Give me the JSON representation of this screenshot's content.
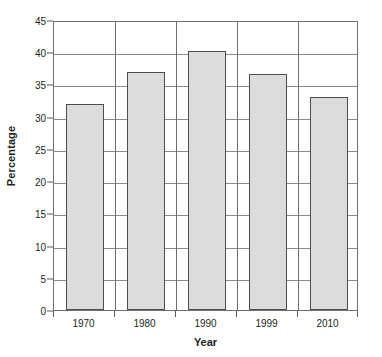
{
  "chart_data": {
    "type": "bar",
    "title": "",
    "subtitle": "",
    "xlabel": "Year",
    "ylabel": "Percentage",
    "categories": [
      "1970",
      "1980",
      "1990",
      "1999",
      "2010"
    ],
    "values": [
      32,
      37,
      40.2,
      36.7,
      33
    ],
    "series": [
      {
        "name": "Percentage",
        "values": [
          32,
          37,
          40.2,
          36.7,
          33
        ]
      }
    ],
    "ylim": [
      0,
      45
    ],
    "y_ticks": [
      0,
      5,
      10,
      15,
      20,
      25,
      30,
      35,
      40,
      45
    ],
    "y_tick_labels": [
      "0",
      "5",
      "10",
      "15",
      "20",
      "25",
      "30",
      "35",
      "40",
      "45"
    ],
    "x_tick_labels": [
      "1970",
      "1980",
      "1990",
      "1999",
      "2010"
    ],
    "grid": true,
    "grid_axis": "y",
    "legend": false,
    "legend_position": "none",
    "annotations": [],
    "colors": {
      "bar_fill": "#dcdcdc",
      "bar_border": "#4d4d4d",
      "gridline": "#8a8a8a",
      "axis": "#6e6e6e",
      "text": "#231f20",
      "background": "#ffffff"
    }
  }
}
